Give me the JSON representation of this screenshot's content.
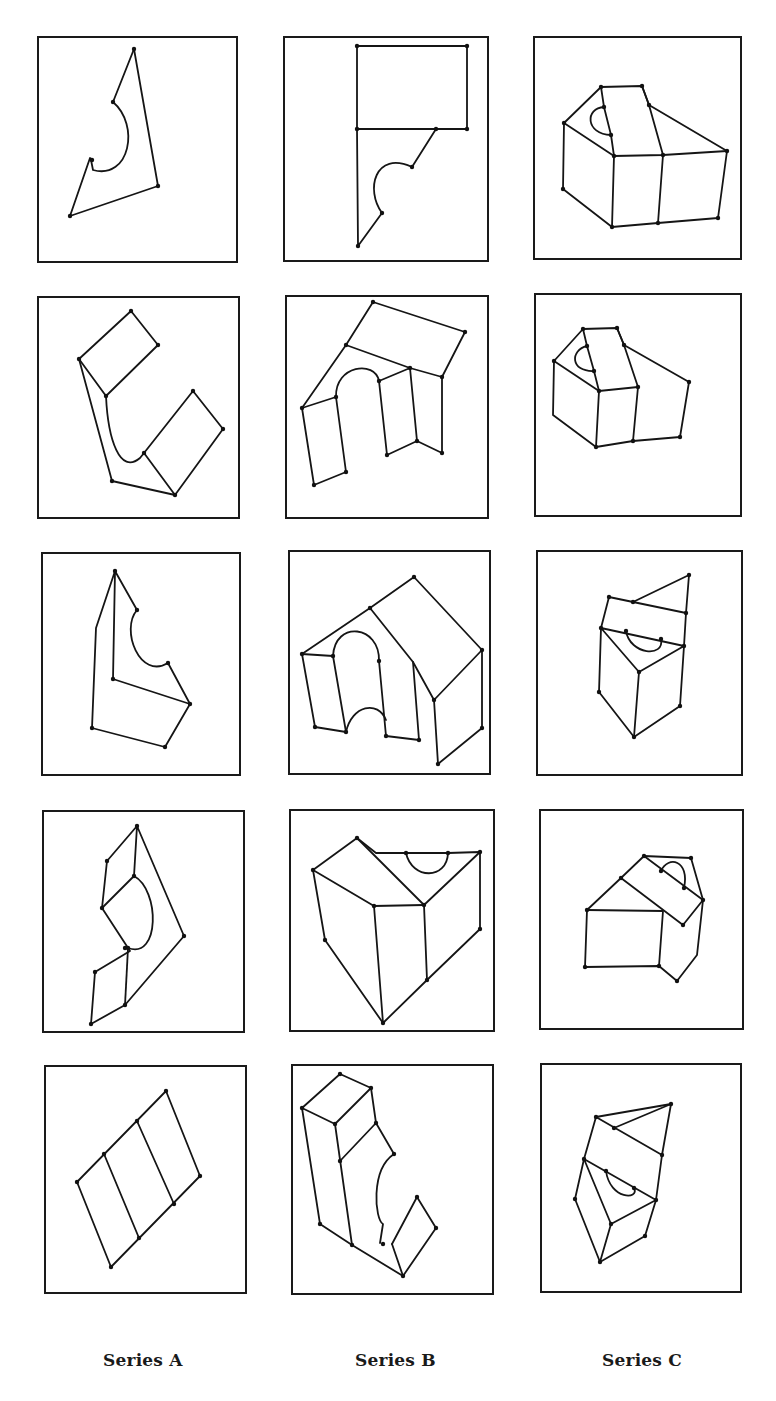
{
  "figure": {
    "captions": [
      "Series A",
      "Series B",
      "Series C"
    ],
    "colors": {
      "ink": "#151515",
      "background": "#ffffff"
    }
  },
  "panels": [
    {
      "id": "A1",
      "series": "A",
      "row": 1,
      "box": [
        38,
        37,
        237,
        262
      ],
      "paths": [
        "M 134 49 L 113 102",
        "M 134 49 L 158 186 L 70 216 L 90 158 L 93 160",
        "M 113 102 C 140 125 130 180 93 170 L 91 160"
      ],
      "vertices": [
        [
          134,
          49
        ],
        [
          113,
          102
        ],
        [
          92,
          160
        ],
        [
          158,
          186
        ],
        [
          70,
          216
        ]
      ]
    },
    {
      "id": "B1",
      "series": "B",
      "row": 1,
      "box": [
        284,
        37,
        488,
        261
      ],
      "paths": [
        "M 357 46 L 467 46 L 467 129 L 357 129 Z",
        "M 357 129 L 358 246 L 382 213",
        "M 382 213 C 365 190 375 150 412 167 L 436 129"
      ],
      "vertices": [
        [
          357,
          46
        ],
        [
          467,
          46
        ],
        [
          357,
          129
        ],
        [
          467,
          129
        ],
        [
          436,
          129
        ],
        [
          412,
          167
        ],
        [
          382,
          213
        ],
        [
          358,
          246
        ]
      ]
    },
    {
      "id": "C1",
      "series": "C",
      "row": 1,
      "box": [
        534,
        37,
        741,
        259
      ],
      "paths": [
        "M 601 87 L 642 86 L 649 105 L 727 151 L 718 218 L 658 223 L 612 227 L 563 189 L 564 123 Z",
        "M 564 123 L 614 156 L 663 155 L 727 151",
        "M 601 87 L 604 107 L 611 135 L 614 156",
        "M 642 86 L 649 105 L 663 155 L 658 223",
        "M 614 156 L 612 227",
        "M 604 107 C 585 108 585 134 611 135"
      ],
      "vertices": [
        [
          601,
          87
        ],
        [
          642,
          86
        ],
        [
          649,
          105
        ],
        [
          604,
          107
        ],
        [
          611,
          135
        ],
        [
          564,
          123
        ],
        [
          614,
          156
        ],
        [
          663,
          155
        ],
        [
          727,
          151
        ],
        [
          563,
          189
        ],
        [
          612,
          227
        ],
        [
          658,
          223
        ],
        [
          718,
          218
        ]
      ]
    },
    {
      "id": "A2",
      "series": "A",
      "row": 2,
      "box": [
        38,
        297,
        239,
        518
      ],
      "paths": [
        "M 79 359 L 131 311 L 158 345 L 106 396 Z",
        "M 79 359 L 112 481 L 175 495 L 144 453",
        "M 106 396 C 108 440 120 475 140 458 L 144 453",
        "M 144 453 L 193 391 L 223 429 L 175 495"
      ],
      "vertices": [
        [
          131,
          311
        ],
        [
          158,
          345
        ],
        [
          79,
          359
        ],
        [
          106,
          396
        ],
        [
          144,
          453
        ],
        [
          193,
          391
        ],
        [
          223,
          429
        ],
        [
          112,
          481
        ],
        [
          175,
          495
        ]
      ]
    },
    {
      "id": "B2",
      "series": "B",
      "row": 2,
      "box": [
        286,
        296,
        488,
        518
      ],
      "paths": [
        "M 373 302 L 465 332 L 442 377 L 410 368 L 346 345 L 373 302 Z",
        "M 346 345 L 302 408 L 314 485 L 346 472 L 336 397 C 335 365 375 360 379 381 L 387 455 L 417 441 L 442 453 L 442 377",
        "M 302 408 L 336 397",
        "M 379 381 L 410 368 L 417 441"
      ],
      "vertices": [
        [
          373,
          302
        ],
        [
          465,
          332
        ],
        [
          346,
          345
        ],
        [
          410,
          368
        ],
        [
          442,
          377
        ],
        [
          302,
          408
        ],
        [
          336,
          397
        ],
        [
          379,
          381
        ],
        [
          387,
          455
        ],
        [
          417,
          441
        ],
        [
          442,
          453
        ],
        [
          346,
          472
        ],
        [
          314,
          485
        ]
      ]
    },
    {
      "id": "C2",
      "series": "C",
      "row": 2,
      "box": [
        535,
        294,
        741,
        516
      ],
      "paths": [
        "M 583 329 L 617 328 L 624 345 L 689 382 L 680 437 L 633 441 L 596 447 L 553 415 L 554 361 Z",
        "M 554 361 L 599 391 L 638 387",
        "M 583 329 L 587 346 L 594 371 L 599 391",
        "M 617 328 L 624 345 L 638 387 L 633 441",
        "M 599 391 L 596 447",
        "M 587 346 C 570 350 570 372 594 371"
      ],
      "vertices": [
        [
          583,
          329
        ],
        [
          617,
          328
        ],
        [
          624,
          345
        ],
        [
          587,
          346
        ],
        [
          594,
          371
        ],
        [
          554,
          361
        ],
        [
          599,
          391
        ],
        [
          638,
          387
        ],
        [
          689,
          382
        ],
        [
          680,
          437
        ],
        [
          633,
          441
        ],
        [
          596,
          447
        ]
      ]
    },
    {
      "id": "A3",
      "series": "A",
      "row": 3,
      "box": [
        42,
        553,
        240,
        775
      ],
      "paths": [
        "M 115 571 L 96 628 L 92 728 L 165 747 L 190 704 L 113 679 L 115 571 L 137 610",
        "M 137 610 C 120 630 140 680 168 663 L 190 704"
      ],
      "vertices": [
        [
          115,
          571
        ],
        [
          137,
          610
        ],
        [
          168,
          663
        ],
        [
          113,
          679
        ],
        [
          190,
          704
        ],
        [
          92,
          728
        ],
        [
          165,
          747
        ]
      ]
    },
    {
      "id": "B3",
      "series": "B",
      "row": 3,
      "box": [
        289,
        551,
        490,
        774
      ],
      "paths": [
        "M 414 577 L 482 650 L 482 728 L 438 764 L 434 700 L 413 662 L 370 608 L 302 654 L 315 727 L 346 732",
        "M 370 608 L 414 577",
        "M 434 700 L 482 650",
        "M 413 662 L 419 740 L 386 736 L 379 661",
        "M 302 654 L 333 656 L 346 732",
        "M 333 656 C 335 620 380 625 379 661",
        "M 346 732 C 352 705 378 700 386 720"
      ],
      "vertices": [
        [
          414,
          577
        ],
        [
          370,
          608
        ],
        [
          302,
          654
        ],
        [
          333,
          656
        ],
        [
          379,
          661
        ],
        [
          482,
          650
        ],
        [
          434,
          700
        ],
        [
          315,
          727
        ],
        [
          346,
          732
        ],
        [
          386,
          736
        ],
        [
          419,
          740
        ],
        [
          482,
          728
        ],
        [
          438,
          764
        ]
      ]
    },
    {
      "id": "C3",
      "series": "C",
      "row": 3,
      "box": [
        537,
        551,
        742,
        775
      ],
      "paths": [
        "M 609 597 L 633 602 L 689 575 L 686 613 L 609 597 L 601 628 L 599 692 L 634 737 L 680 706 L 684 646 L 686 613",
        "M 601 628 L 684 646 L 639 672 L 601 628",
        "M 639 672 L 634 737",
        "M 626 631 C 630 655 665 658 661 639"
      ],
      "vertices": [
        [
          689,
          575
        ],
        [
          609,
          597
        ],
        [
          633,
          602
        ],
        [
          686,
          613
        ],
        [
          601,
          628
        ],
        [
          626,
          631
        ],
        [
          661,
          639
        ],
        [
          684,
          646
        ],
        [
          639,
          672
        ],
        [
          599,
          692
        ],
        [
          680,
          706
        ],
        [
          634,
          737
        ]
      ]
    },
    {
      "id": "A4",
      "series": "A",
      "row": 4,
      "box": [
        43,
        811,
        244,
        1032
      ],
      "paths": [
        "M 137 826 L 107 861 L 102 908 L 130 951 L 95 972 L 91 1024 L 125 1005 L 184 936 L 137 826 L 134 876",
        "M 102 908 L 134 876 C 160 890 160 960 128 948",
        "M 128 948 L 125 1005"
      ],
      "vertices": [
        [
          137,
          826
        ],
        [
          107,
          861
        ],
        [
          134,
          876
        ],
        [
          102,
          908
        ],
        [
          184,
          936
        ],
        [
          125,
          948
        ],
        [
          128,
          948
        ],
        [
          95,
          972
        ],
        [
          125,
          1005
        ],
        [
          91,
          1024
        ]
      ]
    },
    {
      "id": "B4",
      "series": "B",
      "row": 4,
      "box": [
        290,
        810,
        494,
        1031
      ],
      "paths": [
        "M 313 870 L 357 838 L 376 853 L 406 853 L 448 853 L 480 852 L 480 929 L 427 980 L 383 1023 L 325 940 L 313 870",
        "M 313 870 L 374 906 L 424 905",
        "M 357 838 L 424 905 L 480 852",
        "M 374 906 L 383 1023",
        "M 424 905 L 427 980",
        "M 406 853 C 412 880 447 880 448 853"
      ],
      "vertices": [
        [
          357,
          838
        ],
        [
          406,
          853
        ],
        [
          448,
          853
        ],
        [
          480,
          852
        ],
        [
          313,
          870
        ],
        [
          424,
          905
        ],
        [
          374,
          906
        ],
        [
          480,
          929
        ],
        [
          325,
          940
        ],
        [
          427,
          980
        ],
        [
          383,
          1023
        ]
      ]
    },
    {
      "id": "C4",
      "series": "C",
      "row": 4,
      "box": [
        540,
        810,
        743,
        1029
      ],
      "paths": [
        "M 644 856 L 691 858 L 703 900 L 697 955 L 677 981 L 659 966 L 585 967 L 587 910 L 621 878 L 644 856",
        "M 587 910 L 663 911 L 659 966",
        "M 621 878 L 683 925 L 703 900",
        "M 644 856 L 703 900",
        "M 661 871 C 668 855 690 860 684 888"
      ],
      "vertices": [
        [
          644,
          856
        ],
        [
          691,
          858
        ],
        [
          621,
          878
        ],
        [
          661,
          871
        ],
        [
          684,
          888
        ],
        [
          703,
          900
        ],
        [
          587,
          910
        ],
        [
          683,
          925
        ],
        [
          585,
          967
        ],
        [
          659,
          966
        ],
        [
          677,
          981
        ]
      ]
    },
    {
      "id": "A5",
      "series": "A",
      "row": 5,
      "box": [
        45,
        1066,
        246,
        1293
      ],
      "paths": [
        "M 77 1182 L 166 1091 L 200 1176 L 111 1267 Z",
        "M 104 1154 L 139 1238",
        "M 137 1121 L 174 1204"
      ],
      "vertices": [
        [
          166,
          1091
        ],
        [
          137,
          1121
        ],
        [
          104,
          1154
        ],
        [
          77,
          1182
        ],
        [
          200,
          1176
        ],
        [
          174,
          1204
        ],
        [
          139,
          1238
        ],
        [
          111,
          1267
        ]
      ]
    },
    {
      "id": "B5",
      "series": "B",
      "row": 5,
      "box": [
        292,
        1065,
        493,
        1294
      ],
      "paths": [
        "M 302 1108 L 340 1074 L 371 1088 L 335 1124 Z",
        "M 302 1108 L 320 1224 L 352 1245 L 403 1276 L 436 1228 L 417 1197",
        "M 335 1124 L 352 1245",
        "M 371 1088 L 376 1123 L 340 1161",
        "M 376 1123 L 394 1154",
        "M 394 1154 C 370 1170 375 1220 383 1224 L 380 1243",
        "M 392 1244 L 417 1197",
        "M 392 1244 L 403 1276"
      ],
      "vertices": [
        [
          340,
          1074
        ],
        [
          371,
          1088
        ],
        [
          302,
          1108
        ],
        [
          335,
          1124
        ],
        [
          376,
          1123
        ],
        [
          394,
          1154
        ],
        [
          340,
          1161
        ],
        [
          417,
          1197
        ],
        [
          320,
          1224
        ],
        [
          436,
          1228
        ],
        [
          383,
          1244
        ],
        [
          352,
          1245
        ],
        [
          403,
          1276
        ]
      ]
    },
    {
      "id": "C5",
      "series": "C",
      "row": 5,
      "box": [
        541,
        1064,
        741,
        1292
      ],
      "paths": [
        "M 596 1117 L 671 1104 L 662 1155 L 596 1117 L 584 1159 L 575 1199 L 600 1262 L 645 1236 L 656 1200 L 662 1155",
        "M 614 1128 L 671 1104",
        "M 584 1159 L 656 1200 L 611 1224 L 584 1159",
        "M 611 1224 L 600 1262",
        "M 606 1171 C 610 1200 640 1200 634 1188"
      ],
      "vertices": [
        [
          671,
          1104
        ],
        [
          596,
          1117
        ],
        [
          614,
          1128
        ],
        [
          662,
          1155
        ],
        [
          584,
          1159
        ],
        [
          606,
          1171
        ],
        [
          634,
          1188
        ],
        [
          656,
          1200
        ],
        [
          575,
          1199
        ],
        [
          611,
          1224
        ],
        [
          645,
          1236
        ],
        [
          600,
          1262
        ]
      ]
    }
  ]
}
